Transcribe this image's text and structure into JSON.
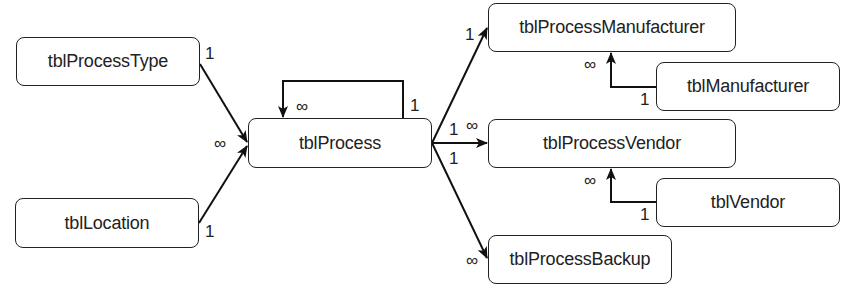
{
  "diagram": {
    "type": "entity-relationship",
    "tables": [
      {
        "id": "tblProcessType",
        "label": "tblProcessType",
        "x": 16,
        "y": 37,
        "w": 184,
        "h": 49
      },
      {
        "id": "tblLocation",
        "label": "tblLocation",
        "x": 15,
        "y": 198,
        "w": 184,
        "h": 50
      },
      {
        "id": "tblProcess",
        "label": "tblProcess",
        "x": 248,
        "y": 118,
        "w": 184,
        "h": 50
      },
      {
        "id": "tblProcessManufacturer",
        "label": "tblProcessManufacturer",
        "x": 488,
        "y": 3,
        "w": 248,
        "h": 49
      },
      {
        "id": "tblManufacturer",
        "label": "tblManufacturer",
        "x": 656,
        "y": 62,
        "w": 184,
        "h": 49
      },
      {
        "id": "tblProcessVendor",
        "label": "tblProcessVendor",
        "x": 488,
        "y": 119,
        "w": 248,
        "h": 49
      },
      {
        "id": "tblVendor",
        "label": "tblVendor",
        "x": 656,
        "y": 178,
        "w": 184,
        "h": 49
      },
      {
        "id": "tblProcessBackup",
        "label": "tblProcessBackup",
        "x": 488,
        "y": 235,
        "w": 184,
        "h": 49
      }
    ],
    "relationships": [
      {
        "from": "tblProcessType",
        "to": "tblProcess",
        "from_card": "1",
        "to_card": "∞"
      },
      {
        "from": "tblLocation",
        "to": "tblProcess",
        "from_card": "1",
        "to_card": "∞"
      },
      {
        "from": "tblProcess",
        "to": "tblProcess",
        "from_card": "1",
        "to_card": "∞"
      },
      {
        "from": "tblProcess",
        "to": "tblProcessManufacturer",
        "from_card": "1",
        "to_card": "1"
      },
      {
        "from": "tblProcess",
        "to": "tblProcessVendor",
        "from_card": "1",
        "to_card": "∞"
      },
      {
        "from": "tblProcess",
        "to": "tblProcessBackup",
        "from_card": "1",
        "to_card": "∞"
      },
      {
        "from": "tblManufacturer",
        "to": "tblProcessManufacturer",
        "from_card": "1",
        "to_card": "∞"
      },
      {
        "from": "tblVendor",
        "to": "tblProcessVendor",
        "from_card": "1",
        "to_card": "∞"
      }
    ],
    "cardinality_labels": {
      "one": "1",
      "many": "∞"
    }
  },
  "labels": {
    "processtype_one": "1",
    "location_one": "1",
    "process_in_many": "∞",
    "self_many": "∞",
    "self_one": "1",
    "pm_one": "1",
    "pv_from_one": "1",
    "pv_to_many": "∞",
    "pb_from_one": "1",
    "pb_to_many": "∞",
    "mfr_many": "∞",
    "mfr_one": "1",
    "vendor_many": "∞",
    "vendor_one": "1"
  }
}
